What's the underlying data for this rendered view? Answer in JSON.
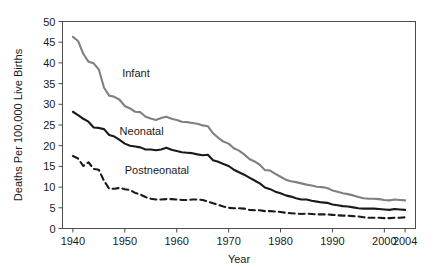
{
  "chart_data": {
    "type": "line",
    "title": "",
    "xlabel": "Year",
    "ylabel": "Deaths Per 100,000 Live Births",
    "xlim": [
      1938,
      2006
    ],
    "ylim": [
      0,
      50
    ],
    "grid": false,
    "legend_position": "inline-annotations",
    "xticks": [
      1940,
      1950,
      1960,
      1970,
      1980,
      1990,
      2000,
      2004
    ],
    "xtick_labels": [
      "1940",
      "1950",
      "1960",
      "1970",
      "1980",
      "1990",
      "2000",
      "2004"
    ],
    "yticks": [
      0,
      5,
      10,
      15,
      20,
      25,
      30,
      35,
      40,
      45,
      50
    ],
    "ytick_labels": [
      "0",
      "5",
      "10",
      "15",
      "20",
      "25",
      "30",
      "35",
      "40",
      "45",
      "50"
    ],
    "annotations": [
      {
        "text": "Infant",
        "x": 1949.5,
        "y": 36.5
      },
      {
        "text": "Neonatal",
        "x": 1949.0,
        "y": 22.7
      },
      {
        "text": "Postneonatal",
        "x": 1950.0,
        "y": 13.2
      }
    ],
    "x": [
      1940,
      1941,
      1942,
      1943,
      1944,
      1945,
      1946,
      1947,
      1948,
      1949,
      1950,
      1951,
      1952,
      1953,
      1954,
      1955,
      1956,
      1957,
      1958,
      1959,
      1960,
      1961,
      1962,
      1963,
      1964,
      1965,
      1966,
      1967,
      1968,
      1969,
      1970,
      1971,
      1972,
      1973,
      1974,
      1975,
      1976,
      1977,
      1978,
      1979,
      1980,
      1981,
      1982,
      1983,
      1984,
      1985,
      1986,
      1987,
      1988,
      1989,
      1990,
      1991,
      1992,
      1993,
      1994,
      1995,
      1996,
      1997,
      1998,
      1999,
      2000,
      2001,
      2002,
      2003,
      2004
    ],
    "series": [
      {
        "name": "Infant",
        "color": "#808080",
        "style": "solid",
        "width": 2.1,
        "values": [
          46.3,
          45.3,
          42.2,
          40.3,
          39.9,
          38.4,
          34.0,
          32.1,
          31.8,
          31.1,
          29.6,
          29.0,
          28.2,
          28.1,
          27.0,
          26.6,
          26.2,
          26.7,
          27.0,
          26.5,
          26.2,
          25.8,
          25.7,
          25.5,
          25.3,
          24.9,
          24.7,
          23.0,
          21.9,
          21.0,
          20.5,
          19.4,
          18.8,
          17.9,
          16.8,
          16.2,
          15.4,
          14.1,
          14.0,
          13.2,
          12.5,
          11.8,
          11.4,
          11.2,
          10.9,
          10.6,
          10.4,
          10.1,
          10.0,
          9.8,
          9.2,
          8.9,
          8.5,
          8.3,
          8.0,
          7.6,
          7.3,
          7.2,
          7.2,
          7.1,
          6.9,
          6.8,
          7.0,
          6.9,
          6.8
        ]
      },
      {
        "name": "Neonatal",
        "color": "#1a1a1a",
        "style": "solid",
        "width": 2.1,
        "values": [
          28.2,
          27.4,
          26.5,
          25.8,
          24.4,
          24.3,
          24.0,
          22.6,
          22.2,
          21.4,
          20.5,
          20.0,
          19.8,
          19.6,
          19.1,
          19.1,
          18.9,
          19.1,
          19.5,
          19.0,
          18.7,
          18.4,
          18.3,
          18.2,
          17.9,
          17.7,
          17.8,
          16.5,
          16.1,
          15.6,
          15.1,
          14.2,
          13.6,
          13.0,
          12.3,
          11.6,
          10.9,
          9.9,
          9.5,
          8.9,
          8.5,
          8.0,
          7.7,
          7.3,
          7.0,
          7.0,
          6.7,
          6.5,
          6.3,
          6.2,
          5.8,
          5.6,
          5.4,
          5.3,
          5.1,
          4.9,
          4.8,
          4.8,
          4.8,
          4.7,
          4.6,
          4.5,
          4.7,
          4.6,
          4.5
        ]
      },
      {
        "name": "Postneonatal",
        "color": "#1a1a1a",
        "style": "dashed",
        "width": 2.1,
        "values": [
          17.5,
          16.9,
          15.1,
          16.0,
          14.4,
          14.2,
          11.5,
          9.6,
          9.6,
          9.8,
          9.5,
          9.3,
          8.6,
          8.2,
          7.6,
          7.2,
          7.0,
          7.0,
          7.1,
          7.1,
          7.0,
          6.9,
          6.9,
          7.0,
          7.0,
          6.9,
          6.5,
          6.1,
          5.7,
          5.3,
          5.0,
          4.9,
          4.9,
          4.8,
          4.5,
          4.4,
          4.4,
          4.2,
          4.2,
          4.1,
          4.0,
          3.8,
          3.7,
          3.6,
          3.5,
          3.6,
          3.5,
          3.4,
          3.4,
          3.4,
          3.3,
          3.2,
          3.1,
          3.1,
          3.0,
          2.9,
          2.7,
          2.6,
          2.6,
          2.6,
          2.5,
          2.5,
          2.6,
          2.6,
          2.7
        ]
      }
    ]
  }
}
